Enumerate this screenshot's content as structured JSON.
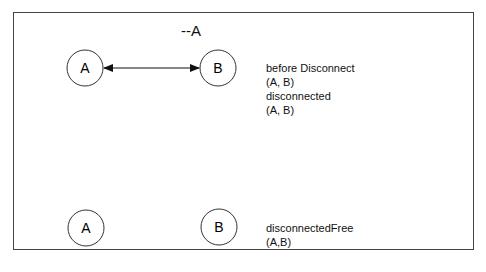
{
  "title": "--A",
  "top": {
    "nodes": [
      {
        "label": "A"
      },
      {
        "label": "B"
      }
    ],
    "edge": "bidirectional",
    "annotations": [
      "before Disconnect",
      "(A, B)",
      "disconnected",
      "(A, B)"
    ]
  },
  "bottom": {
    "nodes": [
      {
        "label": "A"
      },
      {
        "label": "B"
      }
    ],
    "annotations": [
      "disconnectedFree",
      "(A,B)"
    ]
  }
}
